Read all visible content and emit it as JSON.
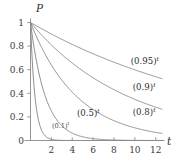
{
  "chart_data": {
    "type": "line",
    "title": "",
    "xlabel": "t",
    "ylabel": "P",
    "xlim": [
      0,
      12.6
    ],
    "ylim": [
      0,
      1.06
    ],
    "grid": false,
    "legend_position": "inline-right",
    "x_ticks": [
      2,
      4,
      6,
      8,
      10,
      12
    ],
    "x_tick_labels": [
      "2",
      "4",
      "6",
      "8",
      "10",
      "12"
    ],
    "y_ticks": [
      0,
      0.2,
      0.4,
      0.6,
      0.8,
      1
    ],
    "y_tick_labels": [
      "0",
      "0.2",
      "0.4",
      "0.6",
      "0.8",
      "1"
    ],
    "series": [
      {
        "name": "(0.95)^t",
        "label_base": "(0.95)",
        "label_exponent": "t",
        "base": 0.95,
        "x": [
          0,
          1,
          2,
          3,
          4,
          5,
          6,
          7,
          8,
          9,
          10,
          11,
          12
        ],
        "values": [
          1.0,
          0.95,
          0.9025,
          0.8574,
          0.8145,
          0.7738,
          0.7351,
          0.6983,
          0.6634,
          0.6302,
          0.5987,
          0.5688,
          0.5404
        ]
      },
      {
        "name": "(0.9)^t",
        "label_base": "(0.9)",
        "label_exponent": "t",
        "base": 0.9,
        "x": [
          0,
          1,
          2,
          3,
          4,
          5,
          6,
          7,
          8,
          9,
          10,
          11,
          12
        ],
        "values": [
          1.0,
          0.9,
          0.81,
          0.729,
          0.6561,
          0.5905,
          0.5314,
          0.4783,
          0.4305,
          0.3874,
          0.3487,
          0.3138,
          0.2824
        ]
      },
      {
        "name": "(0.8)^t",
        "label_base": "(0.8)",
        "label_exponent": "t",
        "base": 0.8,
        "x": [
          0,
          1,
          2,
          3,
          4,
          5,
          6,
          7,
          8,
          9,
          10,
          11,
          12
        ],
        "values": [
          1.0,
          0.8,
          0.64,
          0.512,
          0.4096,
          0.3277,
          0.2621,
          0.2097,
          0.1678,
          0.1342,
          0.1074,
          0.0859,
          0.0687
        ]
      },
      {
        "name": "(0.5)^t",
        "label_base": "(0.5)",
        "label_exponent": "t",
        "base": 0.5,
        "x": [
          0,
          1,
          2,
          3,
          4,
          5,
          6,
          7,
          8,
          9,
          10,
          11,
          12
        ],
        "values": [
          1.0,
          0.5,
          0.25,
          0.125,
          0.0625,
          0.03125,
          0.015625,
          0.0078125,
          0.00390625,
          0.001953125,
          0.0009765625,
          0.00048828125,
          0.000244140625
        ]
      },
      {
        "name": "(0.1)^t",
        "label_base": "(0.1)",
        "label_exponent": "t",
        "base": 0.1,
        "x": [
          0,
          1,
          2,
          3,
          4,
          5,
          6,
          7,
          8,
          9,
          10,
          11,
          12
        ],
        "values": [
          1.0,
          0.1,
          0.01,
          0.001,
          0.0001,
          1e-05,
          1e-06,
          1e-07,
          1e-08,
          1e-09,
          1e-10,
          1e-11,
          1e-12
        ]
      }
    ],
    "annotations": [
      {
        "text": "(0.95)",
        "exponent": "t",
        "x": 9.6,
        "y": 0.645,
        "size": "normal"
      },
      {
        "text": "(0.9)",
        "exponent": "t",
        "x": 9.8,
        "y": 0.432,
        "size": "normal"
      },
      {
        "text": "(0.8)",
        "exponent": "t",
        "x": 9.8,
        "y": 0.215,
        "size": "normal"
      },
      {
        "text": "(0.5)",
        "exponent": "t",
        "x": 4.45,
        "y": 0.205,
        "size": "normal"
      },
      {
        "text": "(0.1)",
        "exponent": "t",
        "x": 2.05,
        "y": 0.105,
        "size": "small"
      }
    ],
    "colors": {
      "curve": "#7a7a7a",
      "axis": "#8a8a8a",
      "text": "#2d2d2d",
      "background": "#ffffff"
    }
  }
}
